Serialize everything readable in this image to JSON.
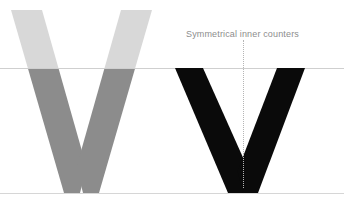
{
  "canvas": {
    "width": 344,
    "height": 207,
    "background": "#ffffff"
  },
  "annotation": {
    "text": "Symmetrical inner counters",
    "color": "#8d8d8d"
  },
  "guides": {
    "cap_height_line": {
      "label": "cap-height-guide",
      "y": 68,
      "color": "#cfcfcf"
    },
    "baseline": {
      "label": "baseline-guide",
      "y": 193,
      "color": "#d6d6d6"
    },
    "center_axis": {
      "label": "center-axis-guide",
      "x": 243,
      "top": 40,
      "bottom": 188,
      "color": "#b5b5b5",
      "style": "dotted"
    }
  },
  "glyphs": [
    {
      "name": "grey-v",
      "character": "V",
      "overshoot_color": "#d8d8d8",
      "body_color": "#8c8c8c",
      "left": 11,
      "right": 152,
      "top": 10,
      "baseline": 193
    },
    {
      "name": "black-v",
      "character": "V",
      "color": "#0a0a0a",
      "left": 175,
      "right": 305,
      "top": 68,
      "baseline": 193
    }
  ]
}
